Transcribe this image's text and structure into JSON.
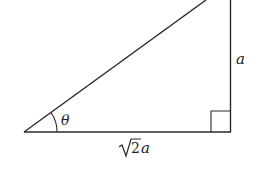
{
  "diagram": {
    "type": "right-triangle",
    "labels": {
      "angle": "θ",
      "vertical_side": "a",
      "base_radical": "2",
      "base_var": "a"
    },
    "stroke_color": "#2a2a2a"
  }
}
